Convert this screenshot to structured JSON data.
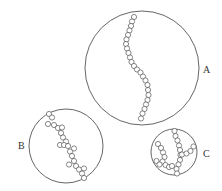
{
  "diagram": {
    "stroke_color": "#555555",
    "bead_radius": 2.6,
    "circles": [
      {
        "id": "A",
        "label": "A",
        "cx": 142,
        "cy": 68,
        "r": 57,
        "label_x": 203,
        "label_y": 65,
        "beads": [
          [
            134,
            17
          ],
          [
            132,
            21.5
          ],
          [
            131,
            26
          ],
          [
            129.5,
            30.5
          ],
          [
            128,
            35
          ],
          [
            126.5,
            39.5
          ],
          [
            126,
            44
          ],
          [
            127,
            48.5
          ],
          [
            128.5,
            53
          ],
          [
            130,
            57.5
          ],
          [
            131.5,
            62
          ],
          [
            134,
            66
          ],
          [
            137,
            69.5
          ],
          [
            140.5,
            72.5
          ],
          [
            143,
            76.5
          ],
          [
            145.5,
            80.5
          ],
          [
            147.5,
            85
          ],
          [
            148,
            90
          ],
          [
            148.5,
            95
          ],
          [
            147.5,
            100
          ],
          [
            146,
            104.5
          ],
          [
            144.5,
            109
          ],
          [
            142.5,
            113.5
          ],
          [
            141,
            118.5
          ]
        ]
      },
      {
        "id": "B",
        "label": "B",
        "cx": 66,
        "cy": 146,
        "r": 37,
        "label_x": 18,
        "label_y": 141,
        "beads": [
          [
            49,
            114
          ],
          [
            52,
            117.5
          ],
          [
            48,
            124
          ],
          [
            54,
            125
          ],
          [
            58,
            128
          ],
          [
            62,
            127.5
          ],
          [
            61,
            133
          ],
          [
            63,
            137.5
          ],
          [
            66,
            141.5
          ],
          [
            60,
            145
          ],
          [
            64,
            145
          ],
          [
            68,
            146
          ],
          [
            74,
            148.5
          ],
          [
            70,
            151.5
          ],
          [
            72,
            156
          ],
          [
            74,
            161
          ],
          [
            69,
            164.5
          ],
          [
            76,
            166
          ],
          [
            79,
            169.5
          ],
          [
            84,
            168.5
          ],
          [
            82,
            173.5
          ],
          [
            84,
            178
          ]
        ]
      },
      {
        "id": "C",
        "label": "C",
        "cx": 174,
        "cy": 152,
        "r": 23,
        "label_x": 203,
        "label_y": 149,
        "beads": [
          [
            174.5,
            131
          ],
          [
            175.5,
            136
          ],
          [
            177.5,
            140.5
          ],
          [
            179,
            145.5
          ],
          [
            180,
            150
          ],
          [
            180.5,
            155
          ],
          [
            180,
            160
          ],
          [
            178.5,
            164.5
          ],
          [
            176.5,
            169
          ],
          [
            177,
            173.5
          ],
          [
            158,
            144
          ],
          [
            161,
            148
          ],
          [
            163,
            152.5
          ],
          [
            164.5,
            157
          ],
          [
            162.5,
            161.5
          ],
          [
            156.5,
            161
          ],
          [
            159.5,
            164.5
          ],
          [
            165.5,
            165
          ],
          [
            169,
            167
          ],
          [
            172,
            166
          ],
          [
            182,
            154.5
          ],
          [
            186.5,
            153.5
          ],
          [
            190.5,
            151
          ],
          [
            193.5,
            146.5
          ]
        ]
      }
    ]
  }
}
